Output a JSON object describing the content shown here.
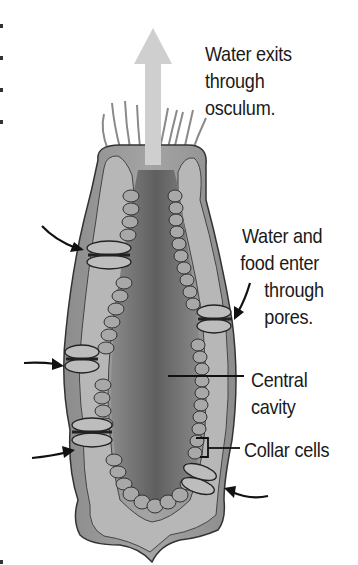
{
  "diagram": {
    "labels": {
      "exit": [
        "Water exits",
        "through",
        "osculum."
      ],
      "enter": [
        "Water and",
        "food enter",
        "through",
        "pores."
      ],
      "cavity": [
        "Central",
        "cavity"
      ],
      "collar": [
        "Collar cells"
      ]
    },
    "colors": {
      "outer_body": "#9a9a9a",
      "inner_wall": "#b8b8b8",
      "cavity": "#6e6e6e",
      "arrow": "#c8c8c8",
      "ink": "#1a1a1a"
    }
  }
}
